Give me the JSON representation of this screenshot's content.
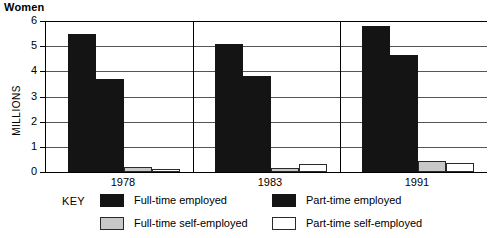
{
  "chart_data": {
    "type": "bar",
    "title": "Women",
    "xlabel": "",
    "ylabel": "MILLIONS",
    "ylim": [
      0,
      6
    ],
    "ytick_labels": [
      "0",
      "1",
      "2",
      "3",
      "4",
      "5",
      "6"
    ],
    "grid": true,
    "legend_position": "bottom",
    "legend_title": "KEY",
    "categories": [
      "1978",
      "1983",
      "1991"
    ],
    "series": [
      {
        "name": "Full-time employed",
        "color": "#141414",
        "values": [
          5.5,
          5.1,
          5.8
        ]
      },
      {
        "name": "Part-time employed",
        "color": "#141414",
        "values": [
          3.7,
          3.8,
          4.65
        ]
      },
      {
        "name": "Full-time self-employed",
        "color": "#c8c8c8",
        "values": [
          0.2,
          0.15,
          0.45
        ]
      },
      {
        "name": "Part-time self-employed",
        "color": "#ffffff",
        "values": [
          0.1,
          0.3,
          0.35
        ]
      }
    ]
  },
  "legend": {
    "key_label": "KEY",
    "items": [
      {
        "label": "Full-time employed",
        "swatch": "black-swatch"
      },
      {
        "label": "Part-time employed",
        "swatch": "black-swatch"
      },
      {
        "label": "Full-time self-employed",
        "swatch": "gray-swatch"
      },
      {
        "label": "Part-time self-employed",
        "swatch": "white-swatch"
      }
    ]
  }
}
